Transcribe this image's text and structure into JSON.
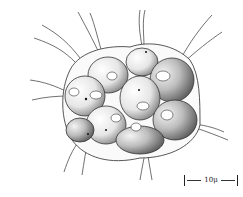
{
  "figure": {
    "scale_bar": {
      "label": "10μ"
    },
    "colors": {
      "ink": "#222222",
      "background": "#ffffff",
      "cell_fill": "#f2f2f2",
      "shade": "#9a9a9a"
    }
  }
}
